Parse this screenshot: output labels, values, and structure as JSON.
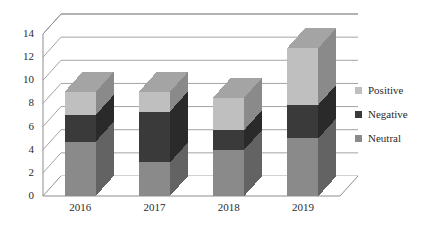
{
  "chart_data": {
    "type": "bar",
    "subtype": "stacked-column-3d",
    "title": "",
    "subtitle": "",
    "xlabel": "",
    "ylabel": "",
    "categories": [
      "2016",
      "2017",
      "2018",
      "2019"
    ],
    "series": [
      {
        "name": "Neutral",
        "color": "#8a8a8a",
        "values": [
          4.7,
          2.9,
          4.0,
          5.0
        ]
      },
      {
        "name": "Negative",
        "color": "#3a3a3a",
        "values": [
          2.3,
          4.4,
          1.7,
          2.9
        ]
      },
      {
        "name": "Positive",
        "color": "#bfbfbf",
        "values": [
          2.0,
          1.7,
          2.8,
          4.9
        ]
      }
    ],
    "stack_order_bottom_to_top": [
      "Neutral",
      "Negative",
      "Positive"
    ],
    "totals": [
      9.0,
      9.0,
      8.5,
      12.8
    ],
    "ylim": [
      0,
      14
    ],
    "ytick_step": 2,
    "ytick_labels": [
      "0",
      "2",
      "4",
      "6",
      "8",
      "10",
      "12",
      "14"
    ],
    "grid": true,
    "grid_axis": "y",
    "legend_position": "right",
    "legend_entries": [
      "Positive",
      "Negative",
      "Neutral"
    ],
    "axis_color": "#8d8d8d",
    "grid_color": "#9a9a9a",
    "background": "#ffffff"
  }
}
